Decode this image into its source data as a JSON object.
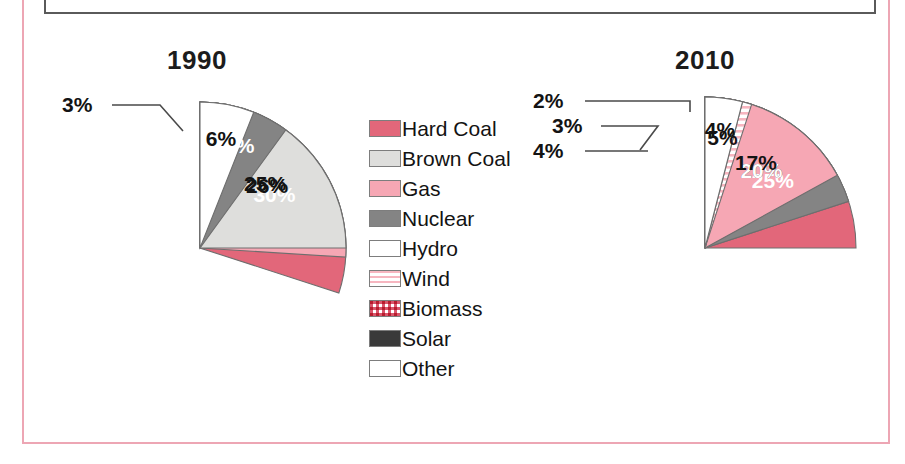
{
  "page": {
    "background": "#ffffff",
    "frame_color": "#eda6b4",
    "box_border_color": "#5a5a5a"
  },
  "legend": {
    "name": "energy-source-legend",
    "items": [
      {
        "label": "Hard Coal",
        "key": "hardcoal",
        "color": "#e2677a",
        "pattern": "solid"
      },
      {
        "label": "Brown Coal",
        "key": "browncoal",
        "color": "#dedeDc",
        "pattern": "solid"
      },
      {
        "label": "Gas",
        "key": "gas",
        "color": "#f6a7b4",
        "pattern": "solid"
      },
      {
        "label": "Nuclear",
        "key": "nuclear",
        "color": "#848484",
        "pattern": "solid"
      },
      {
        "label": "Hydro",
        "key": "hydro",
        "color": "#ffffff",
        "pattern": "solid"
      },
      {
        "label": "Wind",
        "key": "wind",
        "color": "#f7b6c0",
        "pattern": "horizontal-stripes"
      },
      {
        "label": "Biomass",
        "key": "biomass",
        "color": "#d9566c",
        "pattern": "checkered"
      },
      {
        "label": "Solar",
        "key": "solar",
        "color": "#3a3a3a",
        "pattern": "solid"
      },
      {
        "label": "Other",
        "key": "other",
        "color": "#ffffff",
        "pattern": "solid"
      }
    ]
  },
  "chart_data": [
    {
      "type": "pie",
      "title": "1990",
      "name": "pie-chart-1990",
      "start_angle_deg": 0,
      "direction": "clockwise",
      "categories": [
        "Hard Coal",
        "Gas",
        "Brown Coal",
        "Nuclear",
        "Hydro",
        "Other"
      ],
      "values": [
        30,
        26,
        25,
        10,
        3,
        6
      ],
      "labels": [
        "30%",
        "26%",
        "25%",
        "10%",
        "3%",
        "6%"
      ],
      "label_placement": [
        "inside",
        "inside",
        "inside",
        "inside",
        "callout",
        "inside"
      ],
      "unit": "%",
      "slice_styles": [
        {
          "key": "hardcoal",
          "color": "#e2677a",
          "pattern": "solid",
          "label_color": "#ffffff"
        },
        {
          "key": "gas",
          "color": "#f6a7b4",
          "pattern": "solid",
          "label_color": "#131313"
        },
        {
          "key": "browncoal",
          "color": "#dedeDc",
          "pattern": "solid",
          "label_color": "#131313"
        },
        {
          "key": "nuclear",
          "color": "#848484",
          "pattern": "solid",
          "label_color": "#ffffff"
        },
        {
          "key": "hydro",
          "color": "#ffffff",
          "pattern": "solid",
          "label_color": "#131313"
        },
        {
          "key": "other",
          "color": "#ffffff",
          "pattern": "solid",
          "label_color": "#131313"
        }
      ]
    },
    {
      "type": "pie",
      "title": "2010",
      "name": "pie-chart-2010",
      "start_angle_deg": 0,
      "direction": "clockwise",
      "categories": [
        "Hard Coal",
        "Brown Coal",
        "Nuclear",
        "Gas",
        "Wind",
        "Biomass",
        "Hydro",
        "Solar",
        "Other"
      ],
      "values": [
        25,
        20,
        20,
        17,
        5,
        4,
        3,
        2,
        4
      ],
      "labels": [
        "25%",
        "20%",
        "20%",
        "17%",
        "5%",
        "4%",
        "3%",
        "2%",
        "4%"
      ],
      "label_placement": [
        "inside",
        "inside",
        "inside",
        "inside",
        "inside",
        "callout",
        "callout",
        "callout",
        "inside"
      ],
      "unit": "%",
      "slice_styles": [
        {
          "key": "hardcoal",
          "color": "#e2677a",
          "pattern": "solid",
          "label_color": "#ffffff"
        },
        {
          "key": "browncoal",
          "color": "#dedeDc",
          "pattern": "solid",
          "label_color": "#131313"
        },
        {
          "key": "nuclear",
          "color": "#848484",
          "pattern": "solid",
          "label_color": "#ffffff"
        },
        {
          "key": "gas",
          "color": "#f6a7b4",
          "pattern": "solid",
          "label_color": "#131313"
        },
        {
          "key": "wind",
          "color": "#f7b6c0",
          "pattern": "horizontal-stripes",
          "label_color": "#131313"
        },
        {
          "key": "biomass",
          "color": "#d9566c",
          "pattern": "checkered",
          "label_color": "#131313"
        },
        {
          "key": "hydro",
          "color": "#ffffff",
          "pattern": "solid",
          "label_color": "#131313"
        },
        {
          "key": "solar",
          "color": "#3a3a3a",
          "pattern": "solid",
          "label_color": "#131313"
        },
        {
          "key": "other",
          "color": "#ffffff",
          "pattern": "solid",
          "label_color": "#131313"
        }
      ]
    }
  ]
}
